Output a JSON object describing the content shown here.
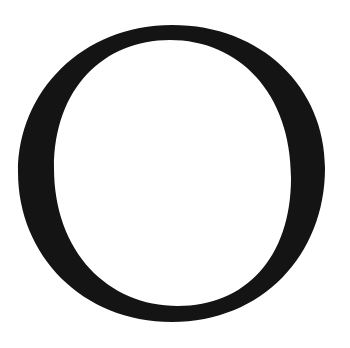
{
  "glyph": {
    "character": "O",
    "style": "serif capital letter",
    "colors": {
      "ink": "#141414",
      "background": "#ffffff"
    }
  }
}
